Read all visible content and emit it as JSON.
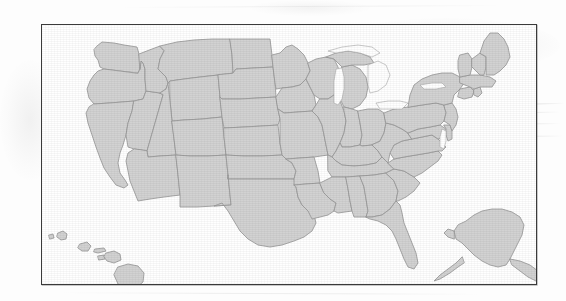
{
  "document": {
    "kind": "scanned-figure",
    "background_color": "#fdfdfd",
    "caption": ""
  },
  "figure": {
    "title": "",
    "frame": {
      "border_color": "#3a3a3a",
      "fill_color": "#ffffff",
      "x": 41,
      "y": 24,
      "width": 496,
      "height": 261
    }
  },
  "map": {
    "name": "united-states-map",
    "projection": "albers-usa",
    "land_fill": "#d2d2d2",
    "border_stroke": "#9a9a9a",
    "water_fill": "#ffffff",
    "label_text": "",
    "regions": [
      {
        "id": "contiguous",
        "label": "Contiguous United States"
      },
      {
        "id": "alaska",
        "label": "Alaska"
      },
      {
        "id": "hawaii",
        "label": "Hawaii"
      }
    ],
    "states": [
      "Washington",
      "Oregon",
      "California",
      "Nevada",
      "Idaho",
      "Montana",
      "Wyoming",
      "Utah",
      "Arizona",
      "Colorado",
      "New Mexico",
      "North Dakota",
      "South Dakota",
      "Nebraska",
      "Kansas",
      "Oklahoma",
      "Texas",
      "Minnesota",
      "Iowa",
      "Missouri",
      "Arkansas",
      "Louisiana",
      "Wisconsin",
      "Illinois",
      "Michigan",
      "Indiana",
      "Ohio",
      "Kentucky",
      "Tennessee",
      "Mississippi",
      "Alabama",
      "Georgia",
      "Florida",
      "South Carolina",
      "North Carolina",
      "Virginia",
      "West Virginia",
      "Maryland",
      "Delaware",
      "Pennsylvania",
      "New Jersey",
      "New York",
      "Connecticut",
      "Rhode Island",
      "Massachusetts",
      "Vermont",
      "New Hampshire",
      "Maine",
      "Alaska",
      "Hawaii"
    ],
    "water_bodies": [
      "Lake Michigan",
      "Lake Superior",
      "Lake Huron",
      "Lake Erie",
      "Lake Ontario",
      "Chesapeake Bay"
    ]
  },
  "artifacts": {
    "description": "faint diagonal photocopy streaks and toner smudges",
    "streak_color": "#a8a8a8"
  }
}
